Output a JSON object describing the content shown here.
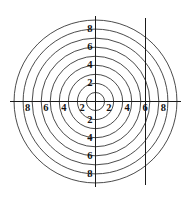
{
  "figure": {
    "title": "",
    "background_color": "#ffffff",
    "line_color": "#2b2b2b",
    "axis_color": "#1a1a1a",
    "label_color": "#111111"
  },
  "chart_data": {
    "type": "line",
    "plot_kind": "concentric-circles-contour",
    "title": "",
    "subtitle": "",
    "xlabel": "",
    "ylabel": "",
    "xlim": [
      -9.6,
      9.6
    ],
    "ylim": [
      -9.6,
      9.6
    ],
    "grid": false,
    "legend": null,
    "legend_position": "none",
    "center": {
      "x": 0,
      "y": 0
    },
    "circle_radii": [
      1,
      2,
      3,
      4,
      5,
      6,
      7,
      8,
      9
    ],
    "circle_count": 9,
    "x_axis": {
      "visible": true,
      "y_value": 0,
      "tick_values": [
        -8,
        -6,
        -4,
        -2,
        2,
        4,
        6,
        8
      ],
      "tick_labels": [
        "8",
        "6",
        "4",
        "2",
        "2",
        "4",
        "6",
        "8"
      ]
    },
    "y_axis": {
      "visible": true,
      "x_value": 0,
      "tick_values": [
        8,
        6,
        4,
        2,
        -2,
        -4,
        -6,
        -8
      ],
      "tick_labels": [
        "8",
        "6",
        "4",
        "2",
        "2",
        "4",
        "6",
        "8"
      ]
    },
    "annotations": [
      {
        "name": "vertical-line",
        "type": "vline",
        "x": 5.5,
        "y_start": -9.2,
        "y_end": 9.2,
        "label": ""
      }
    ],
    "series": [
      {
        "name": "r=1",
        "radius": 1
      },
      {
        "name": "r=2",
        "radius": 2
      },
      {
        "name": "r=3",
        "radius": 3
      },
      {
        "name": "r=4",
        "radius": 4
      },
      {
        "name": "r=5",
        "radius": 5
      },
      {
        "name": "r=6",
        "radius": 6
      },
      {
        "name": "r=7",
        "radius": 7
      },
      {
        "name": "r=8",
        "radius": 8
      },
      {
        "name": "r=9",
        "radius": 9
      }
    ]
  },
  "labels": {
    "x_left": [
      "8",
      "6",
      "4",
      "2"
    ],
    "x_right": [
      "2",
      "4",
      "6",
      "8"
    ],
    "y_top": [
      "8",
      "6",
      "4",
      "2"
    ],
    "y_bottom": [
      "2",
      "4",
      "6",
      "8"
    ]
  }
}
